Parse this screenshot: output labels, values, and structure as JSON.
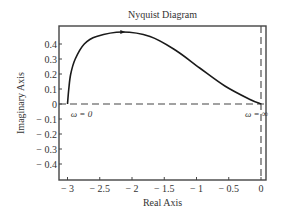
{
  "chart_data": {
    "type": "line",
    "title": "Nyquist Diagram",
    "xlabel": "Real Axis",
    "ylabel": "Imaginary Axis",
    "xlim": [
      -3.1,
      0.08
    ],
    "ylim": [
      -0.5,
      0.52
    ],
    "grid": false,
    "legend": null,
    "x_ticks": [
      -3,
      -2.5,
      -2,
      -1.5,
      -1,
      -0.5,
      0
    ],
    "x_tick_labels": [
      "− 3",
      "− 2.5",
      "− 2",
      "− 1.5",
      "− 1",
      "− 0.5",
      "0"
    ],
    "y_ticks": [
      0.4,
      0.3,
      0.2,
      0.1,
      0,
      -0.1,
      -0.2,
      -0.3,
      -0.4
    ],
    "y_tick_labels": [
      "0.4",
      "0.3",
      "0.2",
      "0.1",
      "0",
      "− 0.1",
      "− 0.2",
      "− 0.3",
      "− 0.4"
    ],
    "series": [
      {
        "name": "Nyquist curve",
        "style": "solid",
        "color": "#1a1a1a",
        "x": [
          -3.0,
          -2.98,
          -2.95,
          -2.88,
          -2.74,
          -2.55,
          -2.15,
          -1.72,
          -1.33,
          -0.95,
          -0.56,
          -0.17,
          0.0
        ],
        "y": [
          0.0,
          0.1,
          0.2,
          0.3,
          0.4,
          0.45,
          0.48,
          0.45,
          0.36,
          0.24,
          0.12,
          0.03,
          0.0
        ]
      }
    ],
    "reference_lines": [
      {
        "orientation": "horizontal",
        "value": 0,
        "style": "dashed"
      },
      {
        "orientation": "vertical",
        "value": 0,
        "style": "dashed"
      }
    ],
    "direction_arrow": {
      "x": -2.15,
      "y": 0.48
    },
    "annotations": [
      {
        "text": "ω = 0",
        "x": -2.95,
        "y": -0.05
      },
      {
        "text": "ω = ∞",
        "x": -0.25,
        "y": -0.05
      }
    ]
  },
  "layout": {
    "frame": {
      "left": 59,
      "top": 26,
      "right": 266,
      "bottom": 180
    },
    "origin_px": {
      "x": 261,
      "y": 104
    },
    "px_per_unit": {
      "x": 64.5,
      "y": 150
    }
  }
}
